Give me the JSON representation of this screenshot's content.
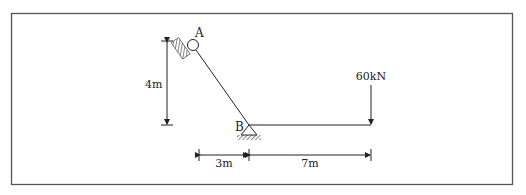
{
  "diagram": {
    "type": "structural-frame",
    "colors": {
      "line": "#222222",
      "frame": "#555555",
      "hatch": "#333333",
      "background": "#ffffff"
    },
    "points": {
      "A": {
        "label": "A",
        "support": "roller-on-inclined-wall"
      },
      "B": {
        "label": "B",
        "support": "pin"
      }
    },
    "members": [
      {
        "from": "A",
        "to": "B",
        "kind": "inclined-member"
      },
      {
        "from": "B",
        "to": "load-point",
        "kind": "horizontal-cantilever"
      }
    ],
    "load": {
      "label": "60kN",
      "direction": "down"
    },
    "dimensions": {
      "vertical": {
        "label": "4m"
      },
      "horizontal_left": {
        "label": "3m"
      },
      "horizontal_right": {
        "label": "7m"
      }
    }
  }
}
